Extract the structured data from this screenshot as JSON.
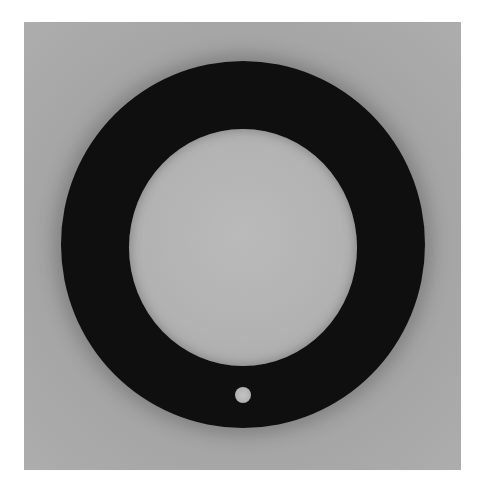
{
  "image": {
    "subject": "black ring gasket with small hole",
    "background_color": "#ffffff",
    "panel_color": "#b4b4b4",
    "ring_color": "#0f0f0f",
    "hole_color": "#c0c0c0"
  }
}
